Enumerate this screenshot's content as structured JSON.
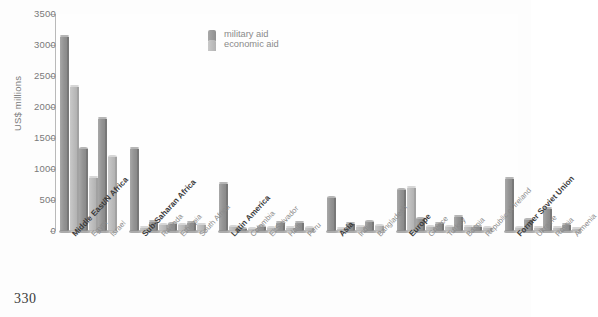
{
  "page": {
    "number": "330"
  },
  "legend": {
    "position": "top-center",
    "items": [
      {
        "label": "military aid",
        "key": "military",
        "color": "#949494"
      },
      {
        "label": "economic aid",
        "key": "economic",
        "color": "#bcbcbc"
      }
    ]
  },
  "axis": {
    "ylabel": "US$ millions",
    "yticks": [
      "0",
      "500",
      "1000",
      "1500",
      "2000",
      "2500",
      "3000",
      "3500"
    ]
  },
  "chart_data": {
    "type": "bar",
    "title": "",
    "xlabel": "",
    "ylabel": "US$ millions",
    "ylim": [
      0,
      3500
    ],
    "ytick_step": 500,
    "grid": false,
    "legend_position": "top-center",
    "series": [
      {
        "name": "military aid",
        "color": "#949494"
      },
      {
        "name": "economic aid",
        "color": "#bcbcbc"
      }
    ],
    "groups": [
      {
        "group": "Middle East/N Africa",
        "categories": [
          {
            "label": "Middle East/N Africa",
            "bold": true,
            "military": 3130,
            "economic": 2330
          },
          {
            "label": "Egypt",
            "bold": false,
            "military": 1320,
            "economic": 860
          },
          {
            "label": "Israel",
            "bold": false,
            "military": 1810,
            "economic": 1190
          }
        ]
      },
      {
        "group": "Sub-Saharan Africa",
        "categories": [
          {
            "label": "Sub-Saharan Africa",
            "bold": true,
            "military": 1330,
            "economic": 55
          },
          {
            "label": "Rwanda",
            "bold": false,
            "military": 150,
            "economic": 95
          },
          {
            "label": "Ethiopia",
            "bold": false,
            "military": 110,
            "economic": 90
          },
          {
            "label": "South Africa",
            "bold": false,
            "military": 130,
            "economic": 100
          }
        ]
      },
      {
        "group": "Latin America",
        "categories": [
          {
            "label": "Latin America",
            "bold": true,
            "military": 760,
            "economic": 60
          },
          {
            "label": "Colombia",
            "bold": false,
            "military": 30,
            "economic": 20
          },
          {
            "label": "El Salvador",
            "bold": false,
            "military": 60,
            "economic": 45
          },
          {
            "label": "Haiti",
            "bold": false,
            "military": 135,
            "economic": 50
          },
          {
            "label": "Peru",
            "bold": false,
            "military": 130,
            "economic": 45
          }
        ]
      },
      {
        "group": "Asia",
        "categories": [
          {
            "label": "Asia",
            "bold": true,
            "military": 530,
            "economic": 40
          },
          {
            "label": "India",
            "bold": false,
            "military": 120,
            "economic": 65
          },
          {
            "label": "Bangladesh",
            "bold": false,
            "military": 140,
            "economic": 80
          }
        ]
      },
      {
        "group": "Europe",
        "categories": [
          {
            "label": "Europe",
            "bold": true,
            "military": 660,
            "economic": 700
          },
          {
            "label": "Greece",
            "bold": false,
            "military": 190,
            "economic": 60
          },
          {
            "label": "Turkey",
            "bold": false,
            "military": 120,
            "economic": 60
          },
          {
            "label": "Bosnia",
            "bold": false,
            "military": 230,
            "economic": 70
          },
          {
            "label": "Republic of Ireland",
            "bold": false,
            "military": 70,
            "economic": 45
          }
        ]
      },
      {
        "group": "Former Soviet Union",
        "categories": [
          {
            "label": "Former Soviet Union",
            "bold": true,
            "military": 840,
            "economic": 45
          },
          {
            "label": "Ukraine",
            "bold": false,
            "military": 175,
            "economic": 55
          },
          {
            "label": "Russia",
            "bold": false,
            "military": 360,
            "economic": 50
          },
          {
            "label": "Armenia",
            "bold": false,
            "military": 105,
            "economic": 40
          }
        ]
      }
    ]
  }
}
